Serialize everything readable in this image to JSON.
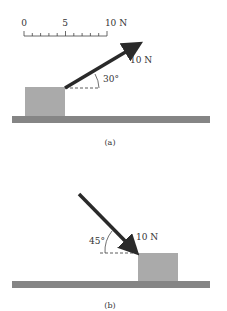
{
  "scale": {
    "ticks": [
      "0",
      "5",
      "10 N"
    ]
  },
  "diagram_a": {
    "force_label": "10 N",
    "angle_label": "30°",
    "caption": "(a)"
  },
  "diagram_b": {
    "force_label": "10 N",
    "angle_label": "45°",
    "caption": "(b)"
  },
  "colors": {
    "block": "#aaaaaa",
    "floor": "#858585",
    "arrow": "#2a2a2a"
  }
}
